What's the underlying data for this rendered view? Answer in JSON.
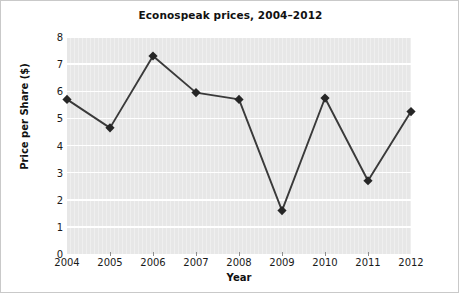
{
  "chart_data": {
    "type": "line",
    "title": "Econospeak prices, 2004–2012",
    "xlabel": "Year",
    "ylabel": "Price per Share ($)",
    "categories": [
      "2004",
      "2005",
      "2006",
      "2007",
      "2008",
      "2009",
      "2010",
      "2011",
      "2012"
    ],
    "values": [
      5.7,
      4.65,
      7.3,
      5.95,
      5.7,
      1.6,
      5.75,
      2.7,
      5.25
    ],
    "series": [
      {
        "name": "Price per Share",
        "values": [
          5.7,
          4.65,
          7.3,
          5.95,
          5.7,
          1.6,
          5.75,
          2.7,
          5.25
        ]
      }
    ],
    "ylim": [
      0,
      8
    ],
    "yticks": [
      "0",
      "1",
      "2",
      "3",
      "4",
      "5",
      "6",
      "7",
      "8"
    ],
    "xticks": [
      "2004",
      "2005",
      "2006",
      "2007",
      "2008",
      "2009",
      "2010",
      "2011",
      "2012"
    ],
    "grid": "horizontal",
    "legend": "none",
    "marker": "diamond",
    "colors": {
      "line": "#3a3a3a",
      "marker": "#262626",
      "plot_background": "#e7e7e7",
      "gridline": "#ffffff",
      "text": "#111111",
      "figure_background": "#ffffff",
      "border": "#c9c9c9"
    }
  }
}
